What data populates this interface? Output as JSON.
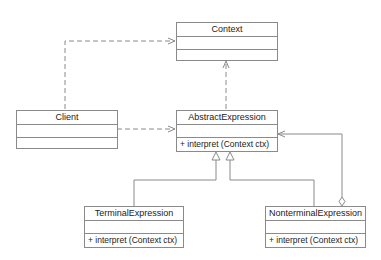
{
  "diagram": {
    "type": "UML class diagram",
    "classes": {
      "context": {
        "name": "Context",
        "attributes": [],
        "operations": []
      },
      "client": {
        "name": "Client",
        "attributes": [],
        "operations": []
      },
      "abstract_expression": {
        "name": "AbstractExpression",
        "attributes": [],
        "operations": [
          "+ interpret (Context ctx)"
        ]
      },
      "terminal_expression": {
        "name": "TerminalExpression",
        "attributes": [],
        "operations": [
          "+ interpret (Context ctx)"
        ]
      },
      "nonterminal_expression": {
        "name": "NonterminalExpression",
        "attributes": [],
        "operations": [
          "+ interpret (Context ctx)"
        ]
      }
    },
    "relationships": [
      {
        "from": "Client",
        "to": "Context",
        "kind": "dependency"
      },
      {
        "from": "Client",
        "to": "AbstractExpression",
        "kind": "dependency"
      },
      {
        "from": "AbstractExpression",
        "to": "Context",
        "kind": "dependency"
      },
      {
        "from": "TerminalExpression",
        "to": "AbstractExpression",
        "kind": "generalization"
      },
      {
        "from": "NonterminalExpression",
        "to": "AbstractExpression",
        "kind": "generalization"
      },
      {
        "from": "NonterminalExpression",
        "to": "AbstractExpression",
        "kind": "aggregation"
      }
    ],
    "colors": {
      "line": "#8a8a8a",
      "text": "#222222",
      "background": "#ffffff"
    }
  }
}
